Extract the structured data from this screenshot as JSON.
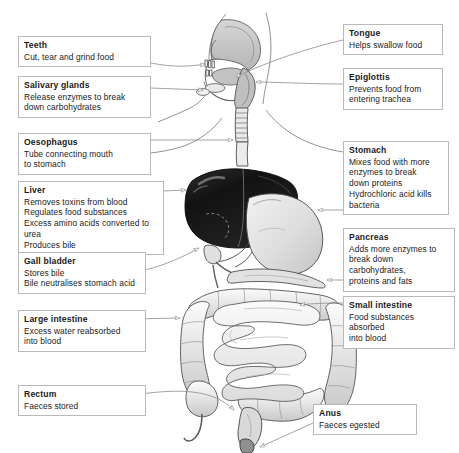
{
  "diagram": {
    "type": "labelled anatomical diagram",
    "background_color": "#ffffff",
    "box_border_color": "#b9b9b9",
    "leader_line_color": "#8c8c8c",
    "organ_colors": {
      "liver": "#171717",
      "stomach": "#d8d8d8",
      "intestine": "#e4e4e4",
      "outline": "#555555",
      "head_tissue": "#c9c9c9"
    }
  },
  "callouts": [
    {
      "id": "teeth",
      "title": "Teeth",
      "lines": [
        "Cut, tear and grind food"
      ],
      "side": "left"
    },
    {
      "id": "salivary-glands",
      "title": "Salivary glands",
      "lines": [
        "Release enzymes to break",
        "down carbohydrates"
      ],
      "side": "left"
    },
    {
      "id": "oesophagus",
      "title": "Oesophagus",
      "lines": [
        "Tube connecting mouth",
        "to stomach"
      ],
      "side": "left"
    },
    {
      "id": "liver",
      "title": "Liver",
      "lines": [
        "Removes toxins from blood",
        "Regulates food substances",
        "Excess amino acids converted to urea",
        "Produces bile"
      ],
      "side": "left"
    },
    {
      "id": "gall-bladder",
      "title": "Gall bladder",
      "lines": [
        "Stores bile",
        "Bile neutralises stomach acid"
      ],
      "side": "left"
    },
    {
      "id": "large-intestine",
      "title": "Large intestine",
      "lines": [
        "Excess water reabsorbed",
        "into blood"
      ],
      "side": "left"
    },
    {
      "id": "rectum",
      "title": "Rectum",
      "lines": [
        "Faeces stored"
      ],
      "side": "left"
    },
    {
      "id": "tongue",
      "title": "Tongue",
      "lines": [
        "Helps swallow food"
      ],
      "side": "right"
    },
    {
      "id": "epiglottis",
      "title": "Epiglottis",
      "lines": [
        "Prevents food from",
        "entering trachea"
      ],
      "side": "right"
    },
    {
      "id": "stomach",
      "title": "Stomach",
      "lines": [
        "Mixes food with more",
        "enzymes to break",
        "down proteins",
        "Hydrochloric acid kills",
        "bacteria"
      ],
      "side": "right"
    },
    {
      "id": "pancreas",
      "title": "Pancreas",
      "lines": [
        "Adds more enzymes to",
        "break down carbohydrates,",
        "proteins and fats"
      ],
      "side": "right"
    },
    {
      "id": "small-intestine",
      "title": "Small intestine",
      "lines": [
        "Food substances absorbed",
        "into blood"
      ],
      "side": "right"
    },
    {
      "id": "anus",
      "title": "Anus",
      "lines": [
        "Faeces egested"
      ],
      "side": "right"
    }
  ]
}
